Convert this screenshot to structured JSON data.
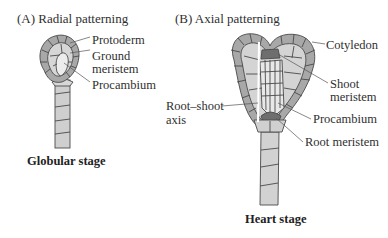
{
  "panels": {
    "a": {
      "title": "(A)  Radial patterning",
      "stage": "Globular stage",
      "labels": {
        "protoderm": "Protoderm",
        "ground_1": "Ground",
        "ground_2": "meristem",
        "procambium": "Procambium"
      }
    },
    "b": {
      "title": "(B)  Axial patterning",
      "stage": "Heart stage",
      "labels": {
        "cotyledon": "Cotyledon",
        "shoot_1": "Shoot",
        "shoot_2": "meristem",
        "procambium": "Procambium",
        "root_meristem": "Root meristem",
        "axis_1": "Root–shoot",
        "axis_2": "axis"
      }
    }
  },
  "colors": {
    "outer_cells": "#a9a9a9",
    "inner_cells": "#d4d4d4",
    "core_cells": "#e6e6e6",
    "meristem": "#6e6e6e",
    "outline": "#4a4a4a"
  }
}
